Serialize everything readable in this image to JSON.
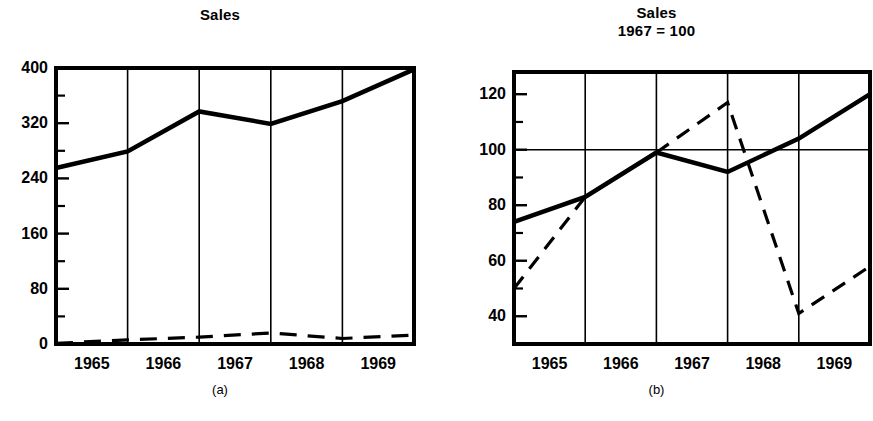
{
  "figure": {
    "caption_a": "(a)",
    "caption_b": "(b)"
  },
  "chart_data": [
    {
      "id": "chart-a",
      "type": "line",
      "title": "Sales",
      "subtitle": "",
      "xlabel": "",
      "ylabel": "",
      "categories": [
        "1965",
        "1966",
        "1967",
        "1968",
        "1969"
      ],
      "xtick_labels": [
        "1965",
        "1966",
        "1967",
        "1968",
        "1969"
      ],
      "ytick_labels": [
        "400",
        "320",
        "240",
        "160",
        "80",
        "0"
      ],
      "ytick_values": [
        400,
        320,
        240,
        160,
        80,
        0
      ],
      "yminor_values": [
        360,
        280,
        200,
        120,
        40
      ],
      "ylim": [
        0,
        400
      ],
      "xlim": [
        1964.5,
        1969.5
      ],
      "grid": "vertical",
      "legend": "none",
      "series": [
        {
          "name": "Sales (dollars)",
          "style": "solid",
          "x": [
            1964.5,
            1965.5,
            1966.5,
            1967.5,
            1968.5,
            1969.5
          ],
          "values": [
            255,
            279,
            337,
            319,
            352,
            398
          ]
        },
        {
          "name": "Units",
          "style": "dashed",
          "x": [
            1964.5,
            1965.5,
            1966.5,
            1967.5,
            1968.5,
            1969.5
          ],
          "values": [
            1,
            6,
            10,
            16,
            8,
            13
          ]
        }
      ]
    },
    {
      "id": "chart-b",
      "type": "line",
      "title": "Sales",
      "subtitle": "1967 = 100",
      "xlabel": "",
      "ylabel": "",
      "categories": [
        "1965",
        "1966",
        "1967",
        "1968",
        "1969"
      ],
      "xtick_labels": [
        "1965",
        "1966",
        "1967",
        "1968",
        "1969"
      ],
      "ytick_labels": [
        "120",
        "100",
        "80",
        "60",
        "40"
      ],
      "ytick_values": [
        120,
        100,
        80,
        60,
        40
      ],
      "yminor_values": [
        130,
        110,
        90,
        70,
        50
      ],
      "ylim": [
        30,
        128
      ],
      "xlim": [
        1964.5,
        1969.5
      ],
      "grid": "vertical-plus-100-line",
      "legend": "none",
      "series": [
        {
          "name": "Sales index",
          "style": "solid",
          "x": [
            1964.5,
            1965.5,
            1966.5,
            1967.5,
            1968.5,
            1969.5
          ],
          "values": [
            74,
            83,
            99,
            92,
            104,
            120
          ]
        },
        {
          "name": "Units index",
          "style": "dashed",
          "x": [
            1964.5,
            1965.5,
            1966.5,
            1967.5,
            1968.5,
            1969.5
          ],
          "values": [
            50,
            83,
            99,
            117,
            41,
            58
          ]
        }
      ]
    }
  ],
  "colors": {
    "ink": "#000000",
    "background": "#ffffff",
    "grid": "#000000"
  }
}
